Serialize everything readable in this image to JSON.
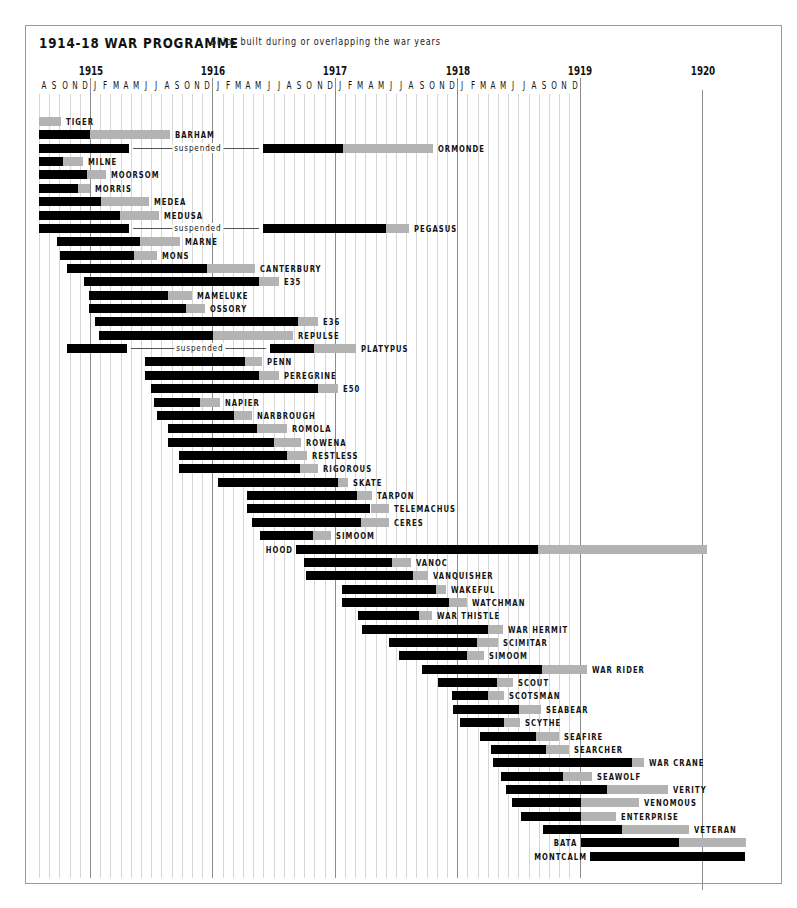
{
  "title": {
    "main": "1914-18 WAR PROGRAMME",
    "subtitle": "Ships built during or overlapping the war years"
  },
  "chart_data": {
    "type": "gantt",
    "title": "1914-18 WAR PROGRAMME",
    "subtitle": "Ships built during or overlapping the war years",
    "time_unit": "month index (0 = Aug 1914)",
    "axis": {
      "start": "Aug 1914",
      "years": [
        {
          "label": "1915",
          "month_index": 5
        },
        {
          "label": "1916",
          "month_index": 17
        },
        {
          "label": "1917",
          "month_index": 29
        },
        {
          "label": "1918",
          "month_index": 41
        },
        {
          "label": "1919",
          "month_index": 53
        },
        {
          "label": "1920",
          "month_index": 65
        }
      ],
      "month_letters": [
        "A",
        "S",
        "O",
        "N",
        "D",
        "J",
        "F",
        "M",
        "A",
        "M",
        "J",
        "J",
        "A",
        "S",
        "O",
        "N",
        "D",
        "J",
        "F",
        "M",
        "A",
        "M",
        "J",
        "J",
        "A",
        "S",
        "O",
        "N",
        "D",
        "J",
        "F",
        "M",
        "A",
        "M",
        "J",
        "J",
        "A",
        "S",
        "O",
        "N",
        "D",
        "J",
        "F",
        "M",
        "A",
        "M",
        "J",
        "J",
        "A",
        "S",
        "O",
        "N",
        "D"
      ]
    },
    "legend": {
      "build": "black bar = under construction",
      "fitting": "grey bar = fitting out / completion",
      "suspended": "line = construction suspended"
    },
    "ships": [
      {
        "name": "TIGER",
        "start": 0,
        "build_end": 0,
        "end": 2.2
      },
      {
        "name": "BARHAM",
        "start": 0,
        "build_end": 5,
        "end": 12.8
      },
      {
        "name": "ORMONDE",
        "start": 0,
        "build_end": 8.8,
        "suspended_until": 22,
        "build2_end": 29.8,
        "end": 38.6
      },
      {
        "name": "MILNE",
        "start": 0,
        "build_end": 2.4,
        "end": 4.3
      },
      {
        "name": "MOORSOM",
        "start": 0,
        "build_end": 4.7,
        "end": 6.6
      },
      {
        "name": "MORRIS",
        "start": 0,
        "build_end": 3.8,
        "end": 5
      },
      {
        "name": "MEDEA",
        "start": 0,
        "build_end": 6.1,
        "end": 10.8
      },
      {
        "name": "MEDUSA",
        "start": 0,
        "build_end": 7.9,
        "end": 11.8
      },
      {
        "name": "PEGASUS",
        "start": 0,
        "build_end": 8.8,
        "suspended_until": 22,
        "build2_end": 34,
        "end": 36.3
      },
      {
        "name": "MARNE",
        "start": 1.8,
        "build_end": 9.9,
        "end": 13.8
      },
      {
        "name": "MONS",
        "start": 2.1,
        "build_end": 9.3,
        "end": 11.6
      },
      {
        "name": "CANTERBURY",
        "start": 2.7,
        "build_end": 16.5,
        "end": 21.2
      },
      {
        "name": "E35",
        "start": 4.4,
        "build_end": 21.6,
        "end": 23.5
      },
      {
        "name": "MAMELUKE",
        "start": 4.9,
        "build_end": 12.6,
        "end": 15
      },
      {
        "name": "OSSORY",
        "start": 4.9,
        "build_end": 14.4,
        "end": 16.3
      },
      {
        "name": "E36",
        "start": 5.5,
        "build_end": 25.4,
        "end": 27.4
      },
      {
        "name": "REPULSE",
        "start": 5.9,
        "build_end": 17.1,
        "end": 24.9
      },
      {
        "name": "PLATYPUS",
        "start": 2.7,
        "build_end": 8.6,
        "suspended_until": 22.6,
        "build2_end": 27,
        "end": 31.1
      },
      {
        "name": "PENN",
        "start": 10.4,
        "build_end": 20.2,
        "end": 21.9
      },
      {
        "name": "PEREGRINE",
        "start": 10.4,
        "build_end": 21.6,
        "end": 23.5
      },
      {
        "name": "E50",
        "start": 11,
        "build_end": 27.4,
        "end": 29.3
      },
      {
        "name": "NAPIER",
        "start": 11.3,
        "build_end": 15.8,
        "end": 17.7
      },
      {
        "name": "NARBROUGH",
        "start": 11.6,
        "build_end": 19.1,
        "end": 20.9
      },
      {
        "name": "ROMOLA",
        "start": 12.6,
        "build_end": 21.4,
        "end": 24.3
      },
      {
        "name": "ROWENA",
        "start": 12.6,
        "build_end": 23,
        "end": 25.7
      },
      {
        "name": "RESTLESS",
        "start": 13.7,
        "build_end": 24.3,
        "end": 26.3
      },
      {
        "name": "RIGOROUS",
        "start": 13.7,
        "build_end": 25.6,
        "end": 27.4
      },
      {
        "name": "SKATE",
        "start": 17.5,
        "build_end": 29.3,
        "end": 30.3
      },
      {
        "name": "TARPON",
        "start": 20.4,
        "build_end": 31.2,
        "end": 32.6
      },
      {
        "name": "TELEMACHUS",
        "start": 20.4,
        "build_end": 32.5,
        "end": 34.3
      },
      {
        "name": "CERES",
        "start": 20.9,
        "build_end": 31.6,
        "end": 34.3
      },
      {
        "name": "SIMOOM",
        "start": 21.7,
        "build_end": 26.9,
        "end": 28.6
      },
      {
        "name": "HOOD",
        "start": 25.2,
        "build_end": 48.9,
        "end": 65.5
      },
      {
        "name": "VANOC",
        "start": 26,
        "build_end": 34.6,
        "end": 36.5
      },
      {
        "name": "VANQUISHER",
        "start": 26.2,
        "build_end": 36.7,
        "end": 38.1
      },
      {
        "name": "WAKEFUL",
        "start": 29.7,
        "build_end": 38.9,
        "end": 39.9
      },
      {
        "name": "WATCHMAN",
        "start": 29.7,
        "build_end": 40.2,
        "end": 42
      },
      {
        "name": "WAR THISTLE",
        "start": 31.3,
        "build_end": 37.3,
        "end": 38.5
      },
      {
        "name": "WAR HERMIT",
        "start": 31.7,
        "build_end": 44,
        "end": 45.5
      },
      {
        "name": "SCIMITAR",
        "start": 34.3,
        "build_end": 42.9,
        "end": 45
      },
      {
        "name": "SIMOOM",
        "start": 35.3,
        "build_end": 42,
        "end": 43.6
      },
      {
        "name": "WAR RIDER",
        "start": 37.5,
        "build_end": 49.3,
        "end": 53.7
      },
      {
        "name": "SCOUT",
        "start": 39.1,
        "build_end": 44.9,
        "end": 46.5
      },
      {
        "name": "SCOTSMAN",
        "start": 40.5,
        "build_end": 44,
        "end": 45.6
      },
      {
        "name": "SEABEAR",
        "start": 40.6,
        "build_end": 47.1,
        "end": 49.2
      },
      {
        "name": "SCYTHE",
        "start": 41.3,
        "build_end": 45.6,
        "end": 47.2
      },
      {
        "name": "SEAFIRE",
        "start": 43.2,
        "build_end": 48.7,
        "end": 51
      },
      {
        "name": "SEARCHER",
        "start": 44.3,
        "build_end": 49.7,
        "end": 52
      },
      {
        "name": "WAR CRANE",
        "start": 44.5,
        "build_end": 58.1,
        "end": 59.3
      },
      {
        "name": "SEAWOLF",
        "start": 45.3,
        "build_end": 51.4,
        "end": 54.2
      },
      {
        "name": "VERITY",
        "start": 45.8,
        "build_end": 55.7,
        "end": 61.7
      },
      {
        "name": "VENOMOUS",
        "start": 46.4,
        "build_end": 53.1,
        "end": 58.8
      },
      {
        "name": "ENTERPRISE",
        "start": 47.3,
        "build_end": 53.1,
        "end": 56.6
      },
      {
        "name": "VETERAN",
        "start": 49.4,
        "build_end": 57.2,
        "end": 63.7
      },
      {
        "name": "BATA",
        "start": 53.1,
        "build_end": 62.7,
        "end": 69.3
      },
      {
        "name": "MONTCALM",
        "start": 54,
        "build_end": 69.2,
        "end": 69.2
      }
    ]
  },
  "suspended_label": "suspended",
  "colors": {
    "build": "#000000",
    "fitting": "#b3b3b3",
    "grid": "#d6d6d6",
    "year_line": "#8c8c8c",
    "frame": "#9a9a9a"
  }
}
